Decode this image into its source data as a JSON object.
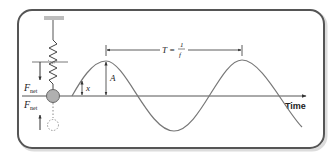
{
  "diagram": {
    "labels": {
      "force_top": "F",
      "force_top_sub": "net",
      "force_bottom": "F",
      "force_bottom_sub": "net",
      "displacement": "x",
      "amplitude": "A",
      "period_lhs": "T =",
      "period_num": "1",
      "period_den": "f",
      "time_axis": "Time"
    },
    "colors": {
      "frame_border": "#555555",
      "frame_shadow": "#cccccc",
      "curve": "#777777",
      "axis": "#555555",
      "mass_fill": "#b0b0b0",
      "ghost_mass": "#aaaaaa",
      "ceiling": "#bdbdbd"
    }
  }
}
